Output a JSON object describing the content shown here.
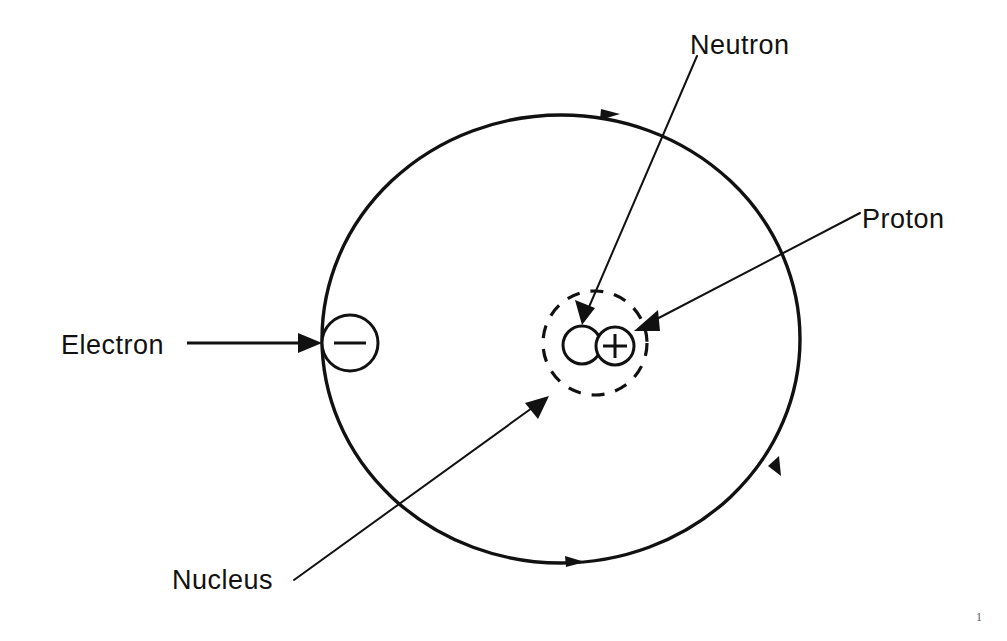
{
  "document": {
    "title": "Atom Structure Diagram",
    "page_number": "1",
    "background_color": "#ffffff",
    "ink_color": "#111111"
  },
  "labels": {
    "electron": "Electron",
    "neutron": "Neutron",
    "proton": "Proton",
    "nucleus": "Nucleus"
  },
  "particles": {
    "electron_charge_symbol": "−",
    "proton_charge_symbol": "+",
    "neutron_charge_symbol": ""
  },
  "diagram": {
    "type": "atom-bohr-model",
    "orbit": {
      "center_x": 561,
      "center_y": 339,
      "radius_x": 239,
      "radius_y": 224,
      "direction": "clockwise",
      "direction_marker_count": 3
    },
    "nucleus_boundary": {
      "center_x": 595,
      "center_y": 343,
      "radius": 52,
      "style": "dashed"
    },
    "electron": {
      "center_x": 350,
      "center_y": 343,
      "radius": 28
    },
    "neutron": {
      "center_x": 582,
      "center_y": 345,
      "radius": 19
    },
    "proton": {
      "center_x": 615,
      "center_y": 346,
      "radius": 19
    }
  }
}
